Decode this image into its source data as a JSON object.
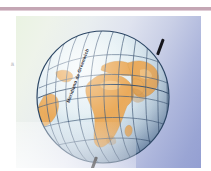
{
  "figure": {
    "kind": "illustration",
    "credit": "© DAE/Sonia Vaz",
    "meridian_label": "Meridiano de Greenwich",
    "margin_mark": "ä"
  },
  "colors": {
    "top_rule": "#c4a6b4",
    "top_rule_soft": "#e0cdd6",
    "background_left": "#eaf3e2",
    "background_right": "#949fd2",
    "ocean_light": "#e9f1f4",
    "ocean_mid": "#cfe0ea",
    "ocean_shadow": "#9bb3cc",
    "land": "#e9a855",
    "land_shadow": "#cf8f3f",
    "land_highlight": "#f2c07c",
    "graticule": "#3c5573",
    "outline": "#2d4765",
    "axis_rod": "#16161c",
    "label_text": "#2b2b33",
    "credit_text": "#4a4a52"
  },
  "globe": {
    "radius": 68,
    "center_x": 71,
    "center_y": 71,
    "axis_tilt_degrees": 20,
    "meridian_count": 11,
    "parallel_count": 5,
    "landmasses": [
      "Africa",
      "Europe",
      "Asia",
      "Arabian Peninsula",
      "South America edge"
    ]
  }
}
